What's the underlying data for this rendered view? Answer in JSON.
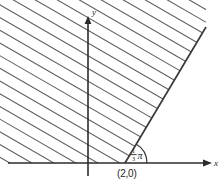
{
  "figure": {
    "background_color": "#ffffff",
    "axis_color": "#2b2b2b",
    "boundary_color": "#3a3a3a",
    "hatch_color": "#5a5a5a",
    "width": 223,
    "height": 190
  },
  "axes": {
    "x_label": "x",
    "y_label": "y",
    "x_axis": {
      "x1": 8,
      "y1": 163,
      "x2": 203,
      "y2": 163,
      "arrow": "right"
    },
    "y_axis": {
      "x1": 88,
      "y1": 176,
      "x2": 88,
      "y2": 22,
      "arrow": "up"
    },
    "origin": {
      "x": 88,
      "y": 163
    }
  },
  "annotations": {
    "vertex_point_label": "(2,0)",
    "vertex_point": {
      "x": 125,
      "y": 163
    },
    "angle_label_numerator": "1",
    "angle_label_denominator": "3",
    "angle_label_symbol": "π",
    "angle_label_plain": "⅓π",
    "angle_degrees": 60,
    "arc_radius": 22
  },
  "ray": {
    "x1": 125,
    "y1": 163,
    "x2": 206,
    "y2": 27
  },
  "chart_data": {
    "type": "line",
    "xlabel": "x",
    "ylabel": "y",
    "grid": false,
    "legend": null,
    "annotations": [
      "(2,0)",
      "⅓π"
    ],
    "series": [
      {
        "name": "boundary ray",
        "x": [
          125,
          206
        ],
        "y": [
          163,
          27
        ],
        "note": "ray from (2,0) at angle pi/3 above the x-axis"
      },
      {
        "name": "x-axis",
        "x": [
          8,
          203
        ],
        "y": [
          163,
          163
        ]
      },
      {
        "name": "y-axis",
        "x": [
          88,
          88
        ],
        "y": [
          176,
          22
        ]
      }
    ],
    "shaded_region": {
      "description": "region above the x-axis and to the left of the ray, filled with parallel diagonal hatching",
      "hatch_angle_degrees": -30,
      "hatch_spacing_px": 11,
      "hatch_count": 17
    }
  }
}
